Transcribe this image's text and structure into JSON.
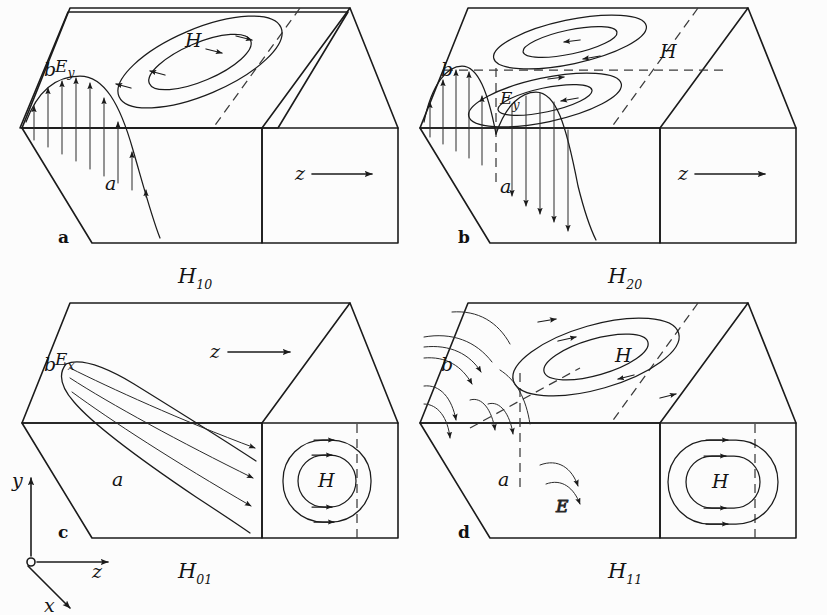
{
  "figure": {
    "background_color": "#fcfcfc",
    "ink_color": "#1b1b1b",
    "panel_count": 4
  },
  "axes_triad": {
    "name": "coordinate-axes",
    "origin_marker": "circle",
    "y_label": "y",
    "z_label": "z",
    "x_label": "x"
  },
  "panels": [
    {
      "key": "a",
      "mode_label": "H",
      "mode_sub": "10",
      "dim_height_label": "b",
      "dim_width_label": "a",
      "e_label": "E",
      "e_sub": "y",
      "h_label": "H",
      "z_label": "z",
      "e_lobes": 1,
      "h_loops": 1,
      "h_loop_face": "top",
      "show_z_arrow": true,
      "z_arrow_location": "front-face"
    },
    {
      "key": "b",
      "mode_label": "H",
      "mode_sub": "20",
      "dim_height_label": "b",
      "dim_width_label": "a",
      "e_label": "E",
      "e_sub": "y",
      "h_label": "H",
      "z_label": "z",
      "e_lobes": 2,
      "h_loops": 2,
      "h_loop_face": "top",
      "show_z_arrow": true,
      "z_arrow_location": "front-face"
    },
    {
      "key": "c",
      "mode_label": "H",
      "mode_sub": "01",
      "dim_height_label": "b",
      "dim_width_label": "a",
      "e_label": "E",
      "e_sub": "x",
      "h_label": "H",
      "z_label": "z",
      "e_lobes": 1,
      "h_loops": 1,
      "h_loop_face": "front",
      "show_z_arrow": true,
      "z_arrow_location": "top-face"
    },
    {
      "key": "d",
      "mode_label": "H",
      "mode_sub": "11",
      "dim_height_label": "b",
      "dim_width_label": "a",
      "e_label": "E",
      "e_sub": "",
      "h_label": "H",
      "h_label_2": "H",
      "z_label": "",
      "e_lobes": 1,
      "h_loops": 2,
      "h_loop_face": "top-and-front",
      "show_z_arrow": false,
      "z_arrow_location": ""
    }
  ]
}
